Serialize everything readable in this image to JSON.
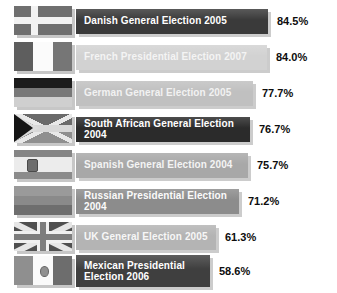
{
  "chart_data": {
    "type": "bar",
    "title": "",
    "xlabel": "",
    "ylabel": "",
    "orientation": "horizontal",
    "value_suffix": "%",
    "xlim": [
      0,
      100
    ],
    "grid": false,
    "legend": false,
    "categories": [
      "Danish General Election 2005",
      "French Presidential Election 2007",
      "German General Election 2005",
      "South African General Election 2004",
      "Spanish General Election 2004",
      "Russian Presidential Election 2004",
      "UK General Election 2005",
      "Mexican Presidential Election 2006"
    ],
    "values": [
      84.5,
      84.0,
      77.7,
      76.7,
      75.7,
      71.2,
      61.3,
      58.6
    ]
  },
  "rows": [
    {
      "label": "Danish General Election 2005",
      "value_text": "84.5%",
      "value": 84.5,
      "bar_color": "#3a3a3a",
      "text_color": "#ffffff",
      "flag_name": "flag-denmark",
      "flag_country": "Denmark",
      "bar_width_px": 192,
      "two_line": false
    },
    {
      "label": "French Presidential Election 2007",
      "value_text": "84.0%",
      "value": 84.0,
      "bar_color": "#d2d2d2",
      "text_color": "#f4f4f4",
      "flag_name": "flag-france",
      "flag_country": "France",
      "bar_width_px": 191,
      "two_line": false
    },
    {
      "label": "German General Election 2005",
      "value_text": "77.7%",
      "value": 77.7,
      "bar_color": "#c0c0c0",
      "text_color": "#f2f2f2",
      "flag_name": "flag-germany",
      "flag_country": "Germany",
      "bar_width_px": 177,
      "two_line": false
    },
    {
      "label": "South African General Election 2004",
      "value_text": "76.7%",
      "value": 76.7,
      "bar_color": "#2b2b2b",
      "text_color": "#ffffff",
      "flag_name": "flag-south-africa",
      "flag_country": "South Africa",
      "bar_width_px": 174,
      "two_line": false
    },
    {
      "label": "Spanish General Election 2004",
      "value_text": "75.7%",
      "value": 75.7,
      "bar_color": "#a8a8a8",
      "text_color": "#f4f4f4",
      "flag_name": "flag-spain",
      "flag_country": "Spain",
      "bar_width_px": 172,
      "two_line": false
    },
    {
      "label": "Russian Presidential Election 2004",
      "value_text": "71.2%",
      "value": 71.2,
      "bar_color": "#8c8c8c",
      "text_color": "#fbfbfb",
      "flag_name": "flag-russia",
      "flag_country": "Russia",
      "bar_width_px": 163,
      "two_line": false
    },
    {
      "label": "UK General Election 2005",
      "value_text": "61.3%",
      "value": 61.3,
      "bar_color": "#b4b4b4",
      "text_color": "#f7f7f7",
      "flag_name": "flag-united-kingdom",
      "flag_country": "United Kingdom",
      "bar_width_px": 140,
      "two_line": false
    },
    {
      "label": "Mexican Presidential\nElection 2006",
      "value_text": "58.6%",
      "value": 58.6,
      "bar_color": "#3f3f3f",
      "text_color": "#ffffff",
      "flag_name": "flag-mexico",
      "flag_country": "Mexico",
      "bar_width_px": 134,
      "two_line": true
    }
  ]
}
